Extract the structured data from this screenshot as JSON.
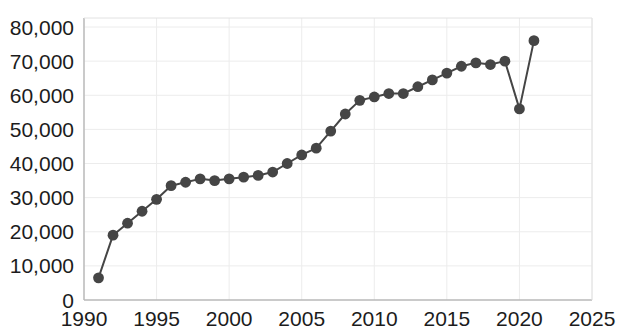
{
  "chart_data": {
    "type": "line",
    "title": "",
    "subtitle": "",
    "xlabel": "",
    "ylabel": "",
    "xlim": [
      1990,
      2025
    ],
    "ylim": [
      0,
      80000
    ],
    "grid": true,
    "legend": null,
    "marker": "circle",
    "series_color": "#454545",
    "line_color": "#454545",
    "x_ticks": [
      "1990",
      "1995",
      "2000",
      "2005",
      "2010",
      "2015",
      "2020",
      "2025"
    ],
    "x_tick_values": [
      1990,
      1995,
      2000,
      2005,
      2010,
      2015,
      2020,
      2025
    ],
    "y_ticks": [
      "0",
      "10,000",
      "20,000",
      "30,000",
      "40,000",
      "50,000",
      "60,000",
      "70,000",
      "80,000"
    ],
    "y_tick_values": [
      0,
      10000,
      20000,
      30000,
      40000,
      50000,
      60000,
      70000,
      80000
    ],
    "x": [
      1991,
      1992,
      1993,
      1994,
      1995,
      1996,
      1997,
      1998,
      1999,
      2000,
      2001,
      2002,
      2003,
      2004,
      2005,
      2006,
      2007,
      2008,
      2009,
      2010,
      2011,
      2012,
      2013,
      2014,
      2015,
      2016,
      2017,
      2018,
      2019,
      2020,
      2021
    ],
    "values": [
      6500,
      19000,
      22500,
      26000,
      29500,
      33500,
      34500,
      35500,
      35000,
      35500,
      36000,
      36500,
      37500,
      40000,
      42500,
      44500,
      49500,
      54500,
      58500,
      59500,
      60500,
      60500,
      62500,
      64500,
      66500,
      68500,
      69500,
      69000,
      70000,
      56000,
      76000
    ],
    "series": [
      {
        "name": "series-1",
        "color": "#454545",
        "values": [
          6500,
          19000,
          22500,
          26000,
          29500,
          33500,
          34500,
          35500,
          35000,
          35500,
          36000,
          36500,
          37500,
          40000,
          42500,
          44500,
          49500,
          54500,
          58500,
          59500,
          60500,
          60500,
          62500,
          64500,
          66500,
          68500,
          69500,
          69000,
          70000,
          56000,
          76000
        ]
      }
    ]
  },
  "axes": {
    "plot_left_px": 84,
    "plot_right_px": 592,
    "plot_top_px": 18,
    "plot_bottom_px": 300,
    "y_value_top_px": 27,
    "y_value_bottom_px": 300
  }
}
